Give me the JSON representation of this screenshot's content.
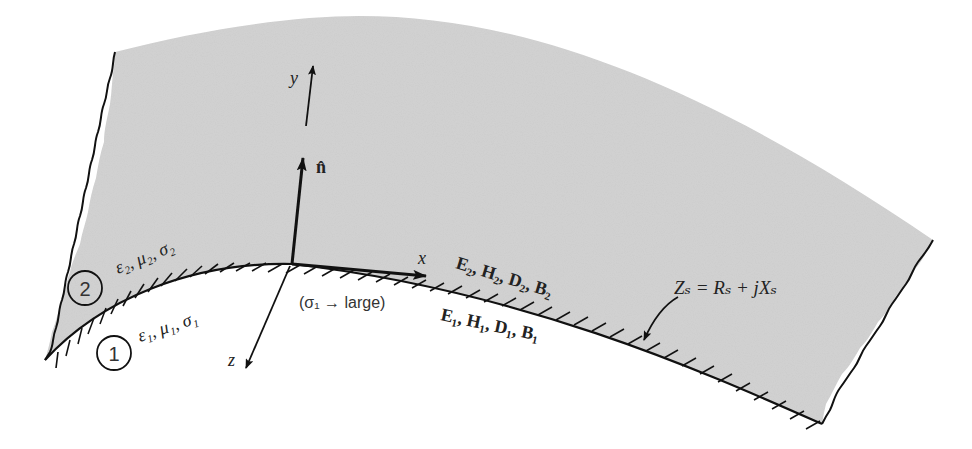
{
  "figure": {
    "colors": {
      "medium2_fill": "#d3d3d3",
      "background": "#ffffff",
      "ink": "#111111"
    },
    "axes": {
      "y_label": "y",
      "x_label": "x",
      "z_label": "z",
      "normal_label": "n̂"
    },
    "region2": {
      "number": "2",
      "params": "ε₂, μ₂, σ₂",
      "fields": "E₂, H₂, D₂, B₂"
    },
    "region1": {
      "number": "1",
      "params": "ε₁, μ₁, σ₁",
      "fields": "E₁, H₁, D₁, B₁",
      "conductivity_note": "(σ₁ → large)"
    },
    "surface_impedance": {
      "label": "Zₛ = Rₛ + jXₛ"
    }
  }
}
